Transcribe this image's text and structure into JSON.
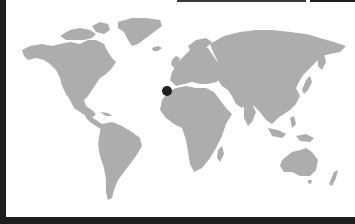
{
  "map": {
    "type": "world-map",
    "land_color": "#adadad",
    "background_color": "#ffffff",
    "marker": {
      "label": "location-marker",
      "x": 167,
      "y": 91,
      "radius": 5,
      "color": "#1f1f1f"
    }
  },
  "frame": {
    "color": "#1e1e1e"
  }
}
